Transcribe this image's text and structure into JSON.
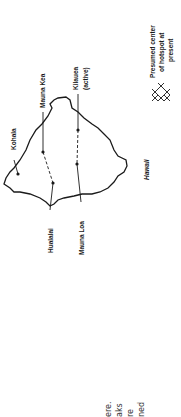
{
  "figure": {
    "island_label": "Hawaii",
    "volcanoes": [
      {
        "name": "Kohala",
        "label": "Kohala"
      },
      {
        "name": "Mauna Kea",
        "label": "Mauna Kea"
      },
      {
        "name": "Kilauea",
        "label": "Kilauea",
        "sublabel": "(active)"
      },
      {
        "name": "Hualalai",
        "label": "Hualalai"
      },
      {
        "name": "Mauna Loa",
        "label": "Mauna Loa"
      }
    ],
    "legend": {
      "symbol": "hotspot-x-cluster",
      "lines": [
        "Presumed center",
        "of hotspot at",
        "present"
      ]
    }
  },
  "body_text_fragments": [
    "ere.",
    "aks",
    "re",
    "ned"
  ],
  "colors": {
    "ink": "#1a1a1a",
    "paper": "#ffffff"
  }
}
